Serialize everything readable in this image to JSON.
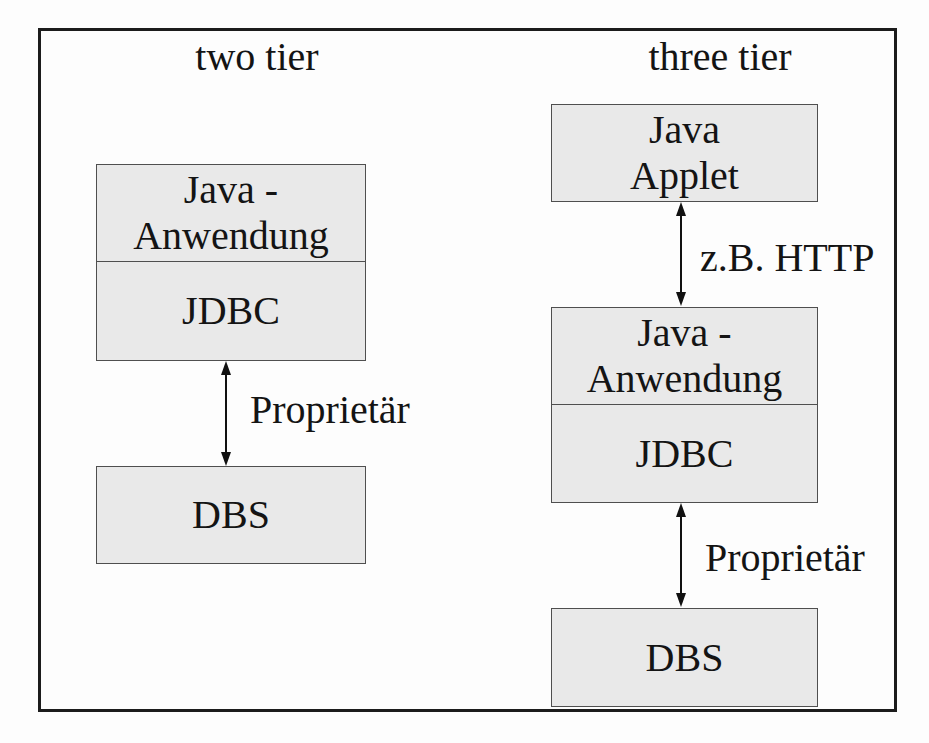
{
  "two_tier": {
    "title": "two tier",
    "app_line1": "Java -",
    "app_line2": "Anwendung",
    "jdbc_label": "JDBC",
    "connector_label": "Proprietär",
    "dbs_label": "DBS"
  },
  "three_tier": {
    "title": "three tier",
    "applet_line1": "Java",
    "applet_line2": "Applet",
    "http_connector_label": "z.B. HTTP",
    "app_line1": "Java -",
    "app_line2": "Anwendung",
    "jdbc_label": "JDBC",
    "connector_label": "Proprietär",
    "dbs_label": "DBS"
  },
  "colors": {
    "box_fill": "#e9e9e9",
    "box_border": "#4f4f4f",
    "frame_border": "#1c1c1c",
    "text": "#141414",
    "page_bg": "#fdfdfd"
  }
}
